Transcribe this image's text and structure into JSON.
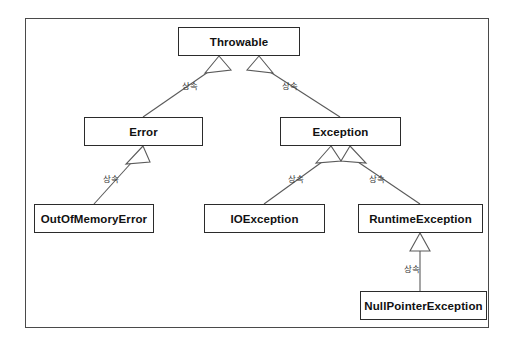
{
  "diagram": {
    "background_color": "#ffffff",
    "frame_border_color": "#4a4a4a",
    "node_border_color": "#2b2b2b",
    "node_fill_color": "#ffffff",
    "text_color": "#111111",
    "edge_color": "#5a5a5a",
    "relation_label": "상속",
    "nodes": [
      {
        "id": "throwable",
        "label": "Throwable",
        "x": 178,
        "y": 27,
        "w": 122,
        "h": 29
      },
      {
        "id": "error",
        "label": "Error",
        "x": 84,
        "y": 117,
        "w": 119,
        "h": 29
      },
      {
        "id": "exception",
        "label": "Exception",
        "x": 280,
        "y": 117,
        "w": 121,
        "h": 29
      },
      {
        "id": "outofmemoryerror",
        "label": "OutOfMemoryError",
        "x": 34,
        "y": 204,
        "w": 120,
        "h": 29
      },
      {
        "id": "ioexception",
        "label": "IOException",
        "x": 204,
        "y": 204,
        "w": 121,
        "h": 29
      },
      {
        "id": "runtimeexception",
        "label": "RuntimeException",
        "x": 358,
        "y": 204,
        "w": 125,
        "h": 29
      },
      {
        "id": "nullpointerexception",
        "label": "NullPointerException",
        "x": 360,
        "y": 291,
        "w": 127,
        "h": 29
      }
    ],
    "edges": [
      {
        "from": "error",
        "to": "throwable",
        "label": "상속",
        "label_x": 182,
        "label_y": 79
      },
      {
        "from": "exception",
        "to": "throwable",
        "label": "상속",
        "label_x": 282,
        "label_y": 79
      },
      {
        "from": "outofmemoryerror",
        "to": "error",
        "label": "상속",
        "label_x": 103,
        "label_y": 172
      },
      {
        "from": "ioexception",
        "to": "exception",
        "label": "상속",
        "label_x": 288,
        "label_y": 172
      },
      {
        "from": "runtimeexception",
        "to": "exception",
        "label": "상속",
        "label_x": 369,
        "label_y": 172
      },
      {
        "from": "nullpointerexception",
        "to": "runtimeexception",
        "label": "상속",
        "label_x": 404,
        "label_y": 262
      }
    ]
  }
}
